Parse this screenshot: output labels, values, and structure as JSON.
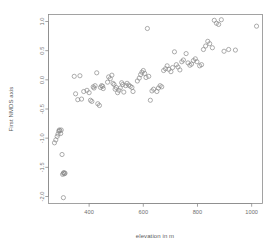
{
  "figure": {
    "background_color": "#ffffff",
    "frame_color": "#8c8c8c",
    "point_color": "#8a8a8a",
    "text_color": "#6e6e6e"
  },
  "chart_data": {
    "type": "scatter",
    "title": "",
    "subtitle": "",
    "xlabel": "elevation in m",
    "ylabel": "First NMDS axis",
    "xlim": [
      250,
      1040
    ],
    "ylim": [
      -2.12,
      1.12
    ],
    "xticks": [
      400,
      600,
      800,
      1000
    ],
    "xtick_labels": [
      "400",
      "600",
      "800",
      "1000"
    ],
    "yticks": [
      1.0,
      0.5,
      0.0,
      -0.5,
      -1.0,
      -1.5,
      -2.0
    ],
    "ytick_labels": [
      "1.0",
      "0.5",
      "0.0",
      "-0.5",
      "-1.0",
      "-1.5",
      "-2.0"
    ],
    "grid": false,
    "legend": null,
    "legend_position": "none",
    "marker": "open-circle",
    "marker_size": 2.1,
    "n_points": 103,
    "annotations": [],
    "x": [
      272,
      277,
      282,
      285,
      288,
      290,
      292,
      295,
      297,
      300,
      302,
      305,
      305,
      307,
      309,
      311,
      345,
      350,
      358,
      366,
      372,
      380,
      392,
      400,
      405,
      410,
      415,
      418,
      422,
      428,
      432,
      438,
      442,
      446,
      450,
      452,
      468,
      472,
      478,
      484,
      488,
      492,
      496,
      500,
      505,
      510,
      515,
      520,
      524,
      528,
      535,
      540,
      546,
      552,
      558,
      562,
      578,
      585,
      590,
      595,
      600,
      605,
      610,
      615,
      620,
      626,
      632,
      638,
      650,
      656,
      662,
      668,
      675,
      682,
      688,
      694,
      702,
      708,
      715,
      722,
      728,
      735,
      742,
      748,
      758,
      765,
      772,
      778,
      785,
      792,
      798,
      808,
      815,
      822,
      830,
      838,
      845,
      855,
      862,
      870,
      878,
      888,
      898,
      915,
      940,
      1018
    ],
    "y": [
      -1.08,
      -1.03,
      -0.97,
      -0.93,
      -0.88,
      -0.86,
      -0.87,
      -0.92,
      -0.86,
      -1.28,
      -1.62,
      -1.6,
      -2.02,
      -1.59,
      -1.61,
      -1.6,
      0.06,
      -0.24,
      -0.34,
      0.07,
      -0.33,
      -0.2,
      -0.18,
      -0.22,
      -0.35,
      -0.37,
      -0.12,
      -0.14,
      -0.1,
      0.12,
      -0.41,
      -0.44,
      -0.13,
      -0.1,
      -0.11,
      -0.15,
      -0.04,
      0.05,
      0.02,
      0.08,
      -0.06,
      -0.08,
      -0.16,
      -0.13,
      -0.22,
      -0.18,
      -0.14,
      -0.05,
      -0.08,
      -0.21,
      -0.1,
      -0.06,
      -0.09,
      -0.11,
      -0.13,
      -0.2,
      -0.02,
      0.03,
      0.09,
      0.13,
      0.16,
      0.11,
      0.04,
      0.88,
      0.06,
      -0.35,
      -0.19,
      -0.16,
      -0.2,
      -0.14,
      -0.1,
      -0.12,
      0.16,
      0.19,
      0.24,
      0.18,
      0.14,
      0.21,
      0.48,
      0.26,
      0.22,
      0.17,
      0.31,
      0.34,
      0.45,
      0.29,
      0.25,
      0.27,
      0.33,
      0.36,
      0.31,
      0.24,
      0.26,
      0.52,
      0.58,
      0.66,
      0.62,
      0.55,
      1.02,
      0.97,
      0.95,
      1.03,
      0.49,
      0.52,
      0.51,
      0.92,
      0.92,
      0.92
    ]
  }
}
